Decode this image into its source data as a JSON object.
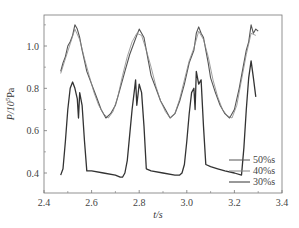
{
  "chart_data": {
    "type": "line",
    "title": "",
    "xlabel": "t/s",
    "ylabel": "P/10^5Pa",
    "xlim": [
      2.4,
      3.4
    ],
    "ylim": [
      0.3,
      1.15
    ],
    "xticks": [
      2.4,
      2.6,
      2.8,
      3.0,
      3.2,
      3.4
    ],
    "xtick_labels": [
      "2.4",
      "2.6",
      "2.8",
      "3.0",
      "3.2",
      "3.4"
    ],
    "yticks": [
      0.4,
      0.6,
      0.8,
      1.0
    ],
    "ytick_labels": [
      "0.4",
      "0.6",
      "0.8",
      "1.0"
    ],
    "grid": false,
    "legend_position": "lower right",
    "series": [
      {
        "name": "50%s",
        "color": "#555555",
        "x": [
          2.47,
          2.48,
          2.49,
          2.5,
          2.51,
          2.52,
          2.53,
          2.54,
          2.55,
          2.56,
          2.57,
          2.58,
          2.6,
          2.62,
          2.64,
          2.66,
          2.68,
          2.7,
          2.72,
          2.74,
          2.76,
          2.78,
          2.79,
          2.8,
          2.81,
          2.82,
          2.83,
          2.84,
          2.85,
          2.87,
          2.89,
          2.91,
          2.93,
          2.95,
          2.97,
          2.99,
          3.01,
          3.03,
          3.04,
          3.05,
          3.06,
          3.07,
          3.08,
          3.09,
          3.1,
          3.12,
          3.14,
          3.16,
          3.18,
          3.2,
          3.22,
          3.24,
          3.25,
          3.26,
          3.27,
          3.28,
          3.29,
          3.3
        ],
        "values": [
          0.88,
          0.92,
          0.95,
          1.0,
          1.02,
          1.05,
          1.1,
          1.08,
          1.04,
          0.98,
          0.93,
          0.88,
          0.82,
          0.76,
          0.7,
          0.66,
          0.68,
          0.72,
          0.8,
          0.88,
          0.96,
          1.02,
          1.05,
          1.08,
          1.06,
          1.04,
          0.98,
          0.92,
          0.86,
          0.8,
          0.74,
          0.7,
          0.66,
          0.68,
          0.74,
          0.82,
          0.92,
          0.98,
          1.06,
          1.09,
          1.06,
          1.04,
          0.98,
          0.92,
          0.85,
          0.78,
          0.72,
          0.68,
          0.66,
          0.7,
          0.8,
          0.92,
          0.98,
          1.02,
          1.1,
          1.06,
          1.08,
          1.07
        ]
      },
      {
        "name": "40%s",
        "color": "#888888",
        "x": [
          2.47,
          2.49,
          2.51,
          2.53,
          2.55,
          2.57,
          2.59,
          2.61,
          2.63,
          2.65,
          2.67,
          2.69,
          2.71,
          2.73,
          2.75,
          2.77,
          2.79,
          2.81,
          2.83,
          2.85,
          2.87,
          2.89,
          2.91,
          2.93,
          2.95,
          2.97,
          2.99,
          3.01,
          3.03,
          3.05,
          3.07,
          3.09,
          3.11,
          3.13,
          3.15,
          3.17,
          3.19,
          3.21,
          3.23,
          3.25,
          3.27,
          3.29
        ],
        "values": [
          0.87,
          0.94,
          1.01,
          1.08,
          1.03,
          0.94,
          0.86,
          0.78,
          0.72,
          0.68,
          0.66,
          0.69,
          0.76,
          0.86,
          0.95,
          1.02,
          1.06,
          1.05,
          0.98,
          0.9,
          0.81,
          0.74,
          0.69,
          0.66,
          0.68,
          0.75,
          0.84,
          0.93,
          0.99,
          1.07,
          1.03,
          0.95,
          0.84,
          0.76,
          0.7,
          0.67,
          0.66,
          0.72,
          0.84,
          0.96,
          1.06,
          1.05
        ]
      },
      {
        "name": "30%s",
        "color": "#333333",
        "x": [
          2.47,
          2.48,
          2.49,
          2.5,
          2.51,
          2.52,
          2.53,
          2.54,
          2.545,
          2.55,
          2.56,
          2.57,
          2.58,
          2.6,
          2.65,
          2.7,
          2.72,
          2.73,
          2.74,
          2.75,
          2.76,
          2.77,
          2.78,
          2.785,
          2.79,
          2.8,
          2.81,
          2.82,
          2.83,
          2.85,
          2.9,
          2.95,
          2.97,
          2.98,
          2.99,
          3.0,
          3.01,
          3.02,
          3.03,
          3.035,
          3.04,
          3.05,
          3.06,
          3.07,
          3.08,
          3.1,
          3.13,
          3.16,
          3.2,
          3.23,
          3.24,
          3.25,
          3.26,
          3.27,
          3.28,
          3.29
        ],
        "values": [
          0.39,
          0.42,
          0.55,
          0.7,
          0.8,
          0.83,
          0.8,
          0.75,
          0.66,
          0.78,
          0.72,
          0.55,
          0.41,
          0.41,
          0.4,
          0.39,
          0.38,
          0.38,
          0.4,
          0.46,
          0.58,
          0.7,
          0.79,
          0.84,
          0.72,
          0.82,
          0.78,
          0.62,
          0.42,
          0.41,
          0.4,
          0.39,
          0.39,
          0.4,
          0.44,
          0.55,
          0.68,
          0.78,
          0.8,
          0.7,
          0.88,
          0.82,
          0.84,
          0.62,
          0.44,
          0.43,
          0.42,
          0.41,
          0.4,
          0.39,
          0.52,
          0.7,
          0.85,
          0.93,
          0.85,
          0.76
        ]
      }
    ]
  },
  "legend": {
    "items": [
      {
        "label": "50%s"
      },
      {
        "label": "40%s"
      },
      {
        "label": "30%s"
      }
    ]
  },
  "axes": {
    "xlabel": "t/s",
    "ylabel_main": "P/10",
    "ylabel_sup": "5",
    "ylabel_tail": "Pa"
  }
}
